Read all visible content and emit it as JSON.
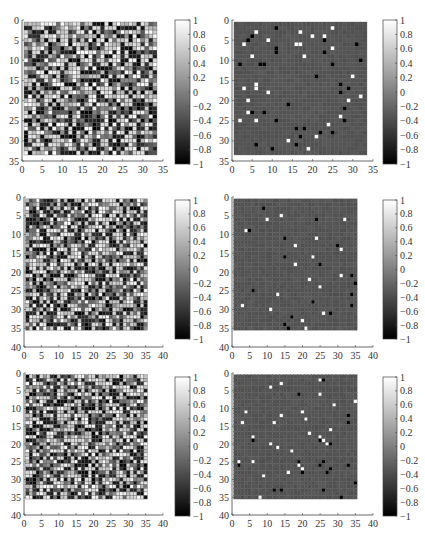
{
  "header_fragment": "",
  "chart_data": [
    {
      "type": "heatmap",
      "panel": "row1-left",
      "description": "Dense random correlation-like matrix",
      "grid_size": 33,
      "xlim": [
        0,
        35
      ],
      "ylim": [
        0,
        35
      ],
      "xticks": [
        "0",
        "5",
        "10",
        "15",
        "20",
        "25",
        "30",
        "35"
      ],
      "yticks": [
        "0",
        "5",
        "10",
        "15",
        "20",
        "25",
        "30",
        "35"
      ],
      "colorbar": {
        "range": [
          -1,
          1
        ],
        "ticks": [
          "1",
          "0.8",
          "0.6",
          "0.4",
          "0.2",
          "0",
          "−0.2",
          "−0.4",
          "−0.6",
          "−0.8",
          "−1"
        ]
      },
      "pattern": "dense",
      "seed": 11
    },
    {
      "type": "heatmap",
      "panel": "row1-right",
      "description": "Sparse matrix: mostly near 0 with scattered ±1 entries",
      "grid_size": 33,
      "xlim": [
        0,
        35
      ],
      "ylim": [
        0,
        35
      ],
      "xticks": [
        "0",
        "5",
        "10",
        "15",
        "20",
        "25",
        "30",
        "35"
      ],
      "yticks": [
        "0",
        "5",
        "10",
        "15",
        "20",
        "25",
        "30",
        "35"
      ],
      "colorbar": {
        "range": [
          -1,
          1
        ],
        "ticks": [
          "1",
          "0.8",
          "0.6",
          "0.4",
          "0.2",
          "0",
          "−0.2",
          "−0.4",
          "−0.6",
          "−0.8",
          "−1"
        ]
      },
      "pattern": "sparse",
      "seed": 23,
      "black_cells": [
        [
          1,
          10
        ],
        [
          3,
          4
        ],
        [
          4,
          3
        ],
        [
          4,
          22
        ],
        [
          5,
          30
        ],
        [
          6,
          10
        ],
        [
          7,
          10
        ],
        [
          7,
          22
        ],
        [
          9,
          31
        ],
        [
          10,
          1
        ],
        [
          10,
          6
        ],
        [
          10,
          7
        ],
        [
          10,
          24
        ],
        [
          13,
          20
        ],
        [
          15,
          26
        ],
        [
          16,
          28
        ],
        [
          17,
          26
        ],
        [
          20,
          13
        ],
        [
          21,
          27
        ],
        [
          21,
          33
        ],
        [
          22,
          4
        ],
        [
          22,
          7
        ],
        [
          24,
          10
        ],
        [
          24,
          27
        ],
        [
          24,
          33
        ],
        [
          26,
          15
        ],
        [
          26,
          17
        ],
        [
          27,
          21
        ],
        [
          27,
          24
        ],
        [
          28,
          16
        ],
        [
          30,
          5
        ],
        [
          30,
          15
        ],
        [
          31,
          9
        ],
        [
          33,
          21
        ],
        [
          33,
          24
        ]
      ],
      "white_cells": [
        [
          1,
          24
        ],
        [
          2,
          5
        ],
        [
          2,
          16
        ],
        [
          3,
          19
        ],
        [
          3,
          22
        ],
        [
          4,
          8
        ],
        [
          5,
          2
        ],
        [
          5,
          15
        ],
        [
          5,
          16
        ],
        [
          6,
          24
        ],
        [
          8,
          4
        ],
        [
          8,
          17
        ],
        [
          13,
          29
        ],
        [
          15,
          5
        ],
        [
          16,
          2
        ],
        [
          16,
          5
        ],
        [
          17,
          8
        ],
        [
          18,
          31
        ],
        [
          19,
          3
        ],
        [
          19,
          28
        ],
        [
          22,
          3
        ],
        [
          23,
          26
        ],
        [
          24,
          1
        ],
        [
          24,
          5
        ],
        [
          25,
          23
        ],
        [
          27,
          33
        ],
        [
          28,
          20
        ],
        [
          29,
          13
        ],
        [
          30,
          33
        ],
        [
          31,
          18
        ],
        [
          33,
          27
        ],
        [
          33,
          30
        ]
      ]
    },
    {
      "type": "heatmap",
      "panel": "row2-left",
      "description": "Dense random matrix",
      "grid_size": 35,
      "xlim": [
        0,
        40
      ],
      "ylim": [
        0,
        40
      ],
      "xticks": [
        "0",
        "5",
        "10",
        "15",
        "20",
        "25",
        "30",
        "35",
        "40"
      ],
      "yticks": [
        "0",
        "5",
        "10",
        "15",
        "20",
        "25",
        "30",
        "35",
        "40"
      ],
      "colorbar": {
        "range": [
          -1,
          1
        ],
        "ticks": [
          "1",
          "0.8",
          "0.6",
          "0.4",
          "0.2",
          "0",
          "−0.2",
          "−0.4",
          "−0.6",
          "−0.8",
          "−1"
        ]
      },
      "pattern": "dense",
      "seed": 37
    },
    {
      "type": "heatmap",
      "panel": "row2-right",
      "description": "Sparse matrix: mostly near 0 with scattered ±1 entries",
      "grid_size": 35,
      "xlim": [
        0,
        40
      ],
      "ylim": [
        0,
        40
      ],
      "xticks": [
        "0",
        "5",
        "10",
        "15",
        "20",
        "25",
        "30",
        "35",
        "40"
      ],
      "yticks": [
        "0",
        "5",
        "10",
        "15",
        "20",
        "25",
        "30",
        "35",
        "40"
      ],
      "colorbar": {
        "range": [
          -1,
          1
        ],
        "ticks": [
          "1",
          "0.8",
          "0.6",
          "0.4",
          "0.2",
          "0",
          "−0.2",
          "−0.4",
          "−0.6",
          "−0.8",
          "−1"
        ]
      },
      "pattern": "sparse",
      "seed": 41,
      "black_cells": [
        [
          2,
          8
        ],
        [
          5,
          23
        ],
        [
          8,
          4
        ],
        [
          10,
          14
        ],
        [
          12,
          29
        ],
        [
          15,
          14
        ],
        [
          17,
          24
        ],
        [
          20,
          33
        ],
        [
          22,
          34
        ],
        [
          24,
          5
        ],
        [
          25,
          33
        ],
        [
          27,
          22
        ],
        [
          28,
          33
        ],
        [
          30,
          27
        ],
        [
          31,
          16
        ],
        [
          33,
          14
        ],
        [
          34,
          15
        ]
      ],
      "white_cells": [
        [
          4,
          13
        ],
        [
          5,
          9
        ],
        [
          5,
          31
        ],
        [
          8,
          3
        ],
        [
          10,
          23
        ],
        [
          12,
          17
        ],
        [
          13,
          30
        ],
        [
          15,
          22
        ],
        [
          17,
          17
        ],
        [
          20,
          30
        ],
        [
          21,
          21
        ],
        [
          23,
          24
        ],
        [
          25,
          12
        ],
        [
          28,
          2
        ],
        [
          29,
          10
        ],
        [
          30,
          25
        ],
        [
          32,
          19
        ],
        [
          34,
          20
        ]
      ]
    },
    {
      "type": "heatmap",
      "panel": "row3-left",
      "description": "Dense random matrix",
      "grid_size": 35,
      "xlim": [
        0,
        40
      ],
      "ylim": [
        0,
        40
      ],
      "xticks": [
        "0",
        "5",
        "10",
        "15",
        "20",
        "25",
        "30",
        "35",
        "40"
      ],
      "yticks": [
        "0",
        "5",
        "10",
        "15",
        "20",
        "25",
        "30",
        "35",
        "40"
      ],
      "colorbar": {
        "range": [
          -1,
          1
        ],
        "ticks": [
          "1",
          "0.8",
          "0.6",
          "0.4",
          "0.2",
          "0",
          "−0.2",
          "−0.4",
          "−0.6",
          "−0.8",
          "−1"
        ]
      },
      "pattern": "dense",
      "seed": 53
    },
    {
      "type": "heatmap",
      "panel": "row3-right",
      "description": "Sparse matrix: mostly near 0 with scattered ±1 entries",
      "grid_size": 35,
      "xlim": [
        0,
        40
      ],
      "ylim": [
        0,
        40
      ],
      "xticks": [
        "0",
        "5",
        "10",
        "15",
        "20",
        "25",
        "30",
        "35",
        "40"
      ],
      "yticks": [
        "0",
        "5",
        "10",
        "15",
        "20",
        "25",
        "30",
        "35",
        "40"
      ],
      "colorbar": {
        "range": [
          -1,
          1
        ],
        "ticks": [
          "1",
          "0.8",
          "0.6",
          "0.4",
          "0.2",
          "0",
          "−0.2",
          "−0.4",
          "−0.6",
          "−0.8",
          "−1"
        ]
      },
      "pattern": "sparse",
      "seed": 67,
      "black_cells": [
        [
          1,
          25
        ],
        [
          5,
          18
        ],
        [
          11,
          32
        ],
        [
          13,
          32
        ],
        [
          18,
          5
        ],
        [
          18,
          24
        ],
        [
          19,
          27
        ],
        [
          24,
          18
        ],
        [
          24,
          25
        ],
        [
          25,
          1
        ],
        [
          25,
          24
        ],
        [
          25,
          32
        ],
        [
          26,
          27
        ],
        [
          27,
          19
        ],
        [
          27,
          26
        ],
        [
          30,
          34
        ],
        [
          32,
          11
        ],
        [
          32,
          13
        ],
        [
          32,
          25
        ],
        [
          34,
          30
        ]
      ],
      "white_cells": [
        [
          1,
          24
        ],
        [
          2,
          13
        ],
        [
          3,
          10
        ],
        [
          5,
          24
        ],
        [
          7,
          34
        ],
        [
          8,
          28
        ],
        [
          10,
          3
        ],
        [
          10,
          19
        ],
        [
          11,
          13
        ],
        [
          12,
          20
        ],
        [
          13,
          2
        ],
        [
          13,
          11
        ],
        [
          15,
          27
        ],
        [
          16,
          21
        ],
        [
          17,
          5
        ],
        [
          17,
          24
        ],
        [
          18,
          25
        ],
        [
          19,
          10
        ],
        [
          19,
          26
        ],
        [
          20,
          12
        ],
        [
          21,
          16
        ],
        [
          24,
          1
        ],
        [
          24,
          5
        ],
        [
          25,
          18
        ],
        [
          26,
          19
        ],
        [
          27,
          15
        ],
        [
          28,
          8
        ],
        [
          34,
          7
        ]
      ]
    }
  ]
}
